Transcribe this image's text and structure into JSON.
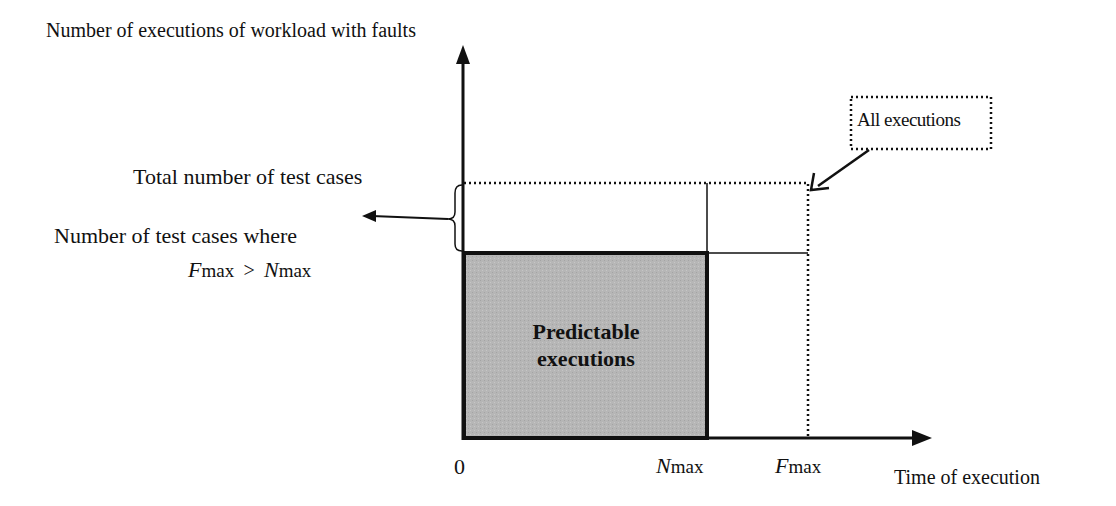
{
  "diagram": {
    "y_axis_label": "Number of executions of workload with faults",
    "x_axis_label": "Time of execution",
    "origin_label": "0",
    "n_max": {
      "symbol": "N",
      "subscript": "max"
    },
    "f_max": {
      "symbol": "F",
      "subscript": "max"
    },
    "total_test_cases_label": "Total number of test cases",
    "test_cases_where_label": "Number of test cases where",
    "condition": {
      "lhs_symbol": "F",
      "lhs_sub": "max",
      "op": ">",
      "rhs_symbol": "N",
      "rhs_sub": "max"
    },
    "predictable_region": {
      "line1": "Predictable",
      "line2": "executions",
      "fill": "#b4b4b4"
    },
    "all_executions_label": "All executions",
    "line_color": "#111111"
  }
}
